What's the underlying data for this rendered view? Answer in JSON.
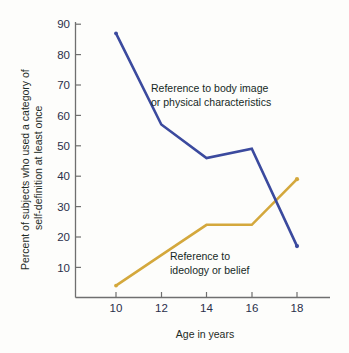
{
  "chart_data": {
    "type": "line",
    "title": "",
    "subtitle": "",
    "xlabel": "Age in years",
    "ylabel": "Percent of subjects who used a category of self-definition at least once",
    "ylabel_line1": "Percent of subjects who used a category of",
    "ylabel_line2": "self-definition at least once",
    "x": [
      10,
      12,
      14,
      16,
      18
    ],
    "xtick_labels": [
      "10",
      "12",
      "14",
      "16",
      "18"
    ],
    "ytick_labels": [
      "10",
      "20",
      "30",
      "40",
      "50",
      "60",
      "70",
      "80",
      "90"
    ],
    "ytick_values": [
      10,
      20,
      30,
      40,
      50,
      60,
      70,
      80,
      90
    ],
    "xlim": [
      9,
      19.4
    ],
    "ylim": [
      0,
      92
    ],
    "grid": false,
    "legend_position": "inline-annotations",
    "series": [
      {
        "name": "Reference to body image or physical characteristics",
        "color": "#3b4a9e",
        "values": [
          87,
          57,
          46,
          49,
          17
        ]
      },
      {
        "name": "Reference to ideology or belief",
        "color": "#d4a83c",
        "values": [
          4,
          14,
          24,
          24,
          39
        ]
      }
    ],
    "annotations": [
      {
        "name": "body-image-annotation",
        "line1": "Reference to body image",
        "line2": "or physical characteristics"
      },
      {
        "name": "ideology-annotation",
        "line1": "Reference to",
        "line2": "ideology or belief"
      }
    ]
  },
  "colors": {
    "series_blue": "#3b4a9e",
    "series_gold": "#d4a83c",
    "axis": "#6f6f6f",
    "tick_text": "#2a2f4a",
    "body_text": "#16291f",
    "background": "#fdfdfb"
  }
}
